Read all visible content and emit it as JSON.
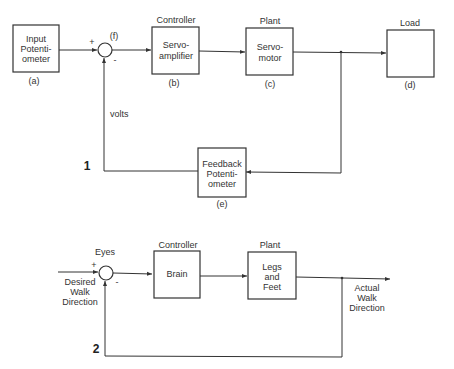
{
  "diagram1": {
    "label": "1",
    "input_box": {
      "lines": [
        "Input",
        "Potenti-",
        "ometer"
      ],
      "tag": "(a)"
    },
    "junction": {
      "tag": "(f)",
      "plus": "+",
      "minus": "-"
    },
    "controller": {
      "heading": "Controller",
      "lines": [
        "Servo-",
        "amplifier"
      ],
      "tag": "(b)"
    },
    "plant": {
      "heading": "Plant",
      "lines": [
        "Servo-",
        "motor"
      ],
      "tag": "(c)"
    },
    "load": {
      "heading": "Load",
      "tag": "(d)"
    },
    "feedback": {
      "lines": [
        "Feedback",
        "Potenti-",
        "ometer"
      ],
      "tag": "(e)"
    },
    "signal_label": "volts"
  },
  "diagram2": {
    "label": "2",
    "junction": {
      "heading": "Eyes",
      "plus": "+",
      "minus": "-"
    },
    "input_label": [
      "Desired",
      "Walk",
      "Direction"
    ],
    "controller": {
      "heading": "Controller",
      "lines": [
        "Brain"
      ]
    },
    "plant": {
      "heading": "Plant",
      "lines": [
        "Legs",
        "and",
        "Feet"
      ]
    },
    "output_label": [
      "Actual",
      "Walk",
      "Direction"
    ]
  }
}
